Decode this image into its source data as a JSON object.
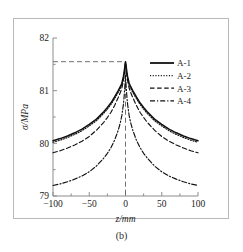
{
  "figure": {
    "caption": "(b)",
    "background_color": "#ffffff",
    "frame_color": "#b9b9b9",
    "axis_color": "#8c8c8c"
  },
  "chart_data": {
    "type": "line",
    "title": "",
    "xlabel": "z/mm",
    "ylabel": "σ/MPa",
    "xlim": [
      -100,
      100
    ],
    "ylim": [
      79,
      82
    ],
    "xticks": [
      -100,
      -50,
      0,
      50,
      100
    ],
    "xtick_labels": [
      "−100",
      "−50",
      "0",
      "50",
      "100"
    ],
    "yticks": [
      79,
      80,
      81,
      82
    ],
    "ytick_labels": [
      "79",
      "80",
      "81",
      "82"
    ],
    "grid": false,
    "legend_position": "upper right",
    "annotations": {
      "peak_guide_horizontal_value": 81.55,
      "peak_guide_vertical_value": 0
    },
    "series": [
      {
        "name": "A-1",
        "style": "solid",
        "color": "#111111",
        "x": [
          -100,
          -90,
          -80,
          -70,
          -60,
          -50,
          -40,
          -30,
          -25,
          -20,
          -15,
          -10,
          -7,
          -5,
          -3,
          -2,
          -1,
          0,
          1,
          2,
          3,
          5,
          7,
          10,
          15,
          20,
          25,
          30,
          40,
          50,
          60,
          70,
          80,
          90,
          100
        ],
        "y": [
          80.05,
          80.09,
          80.14,
          80.2,
          80.27,
          80.36,
          80.46,
          80.6,
          80.68,
          80.77,
          80.88,
          81.0,
          81.08,
          81.14,
          81.26,
          81.34,
          81.45,
          81.55,
          81.45,
          81.34,
          81.26,
          81.14,
          81.08,
          81.0,
          80.88,
          80.77,
          80.68,
          80.6,
          80.46,
          80.36,
          80.27,
          80.2,
          80.14,
          80.09,
          80.05
        ]
      },
      {
        "name": "A-2",
        "style": "dotted",
        "color": "#111111",
        "x": [
          -100,
          -90,
          -80,
          -70,
          -60,
          -50,
          -40,
          -30,
          -25,
          -20,
          -15,
          -10,
          -7,
          -5,
          -3,
          -2,
          -1,
          0,
          1,
          2,
          3,
          5,
          7,
          10,
          15,
          20,
          25,
          30,
          40,
          50,
          60,
          70,
          80,
          90,
          100
        ],
        "y": [
          80.02,
          80.06,
          80.11,
          80.17,
          80.24,
          80.33,
          80.43,
          80.57,
          80.65,
          80.74,
          80.85,
          80.97,
          81.05,
          81.11,
          81.23,
          81.31,
          81.43,
          81.54,
          81.43,
          81.31,
          81.23,
          81.11,
          81.05,
          80.97,
          80.85,
          80.74,
          80.65,
          80.57,
          80.43,
          80.33,
          80.24,
          80.17,
          80.11,
          80.06,
          80.02
        ]
      },
      {
        "name": "A-3",
        "style": "dashed",
        "color": "#111111",
        "x": [
          -100,
          -90,
          -80,
          -70,
          -60,
          -50,
          -40,
          -30,
          -25,
          -20,
          -15,
          -10,
          -7,
          -5,
          -3,
          -2,
          -1,
          0,
          1,
          2,
          3,
          5,
          7,
          10,
          15,
          20,
          25,
          30,
          40,
          50,
          60,
          70,
          80,
          90,
          100
        ],
        "y": [
          79.82,
          79.86,
          79.91,
          79.97,
          80.04,
          80.13,
          80.25,
          80.4,
          80.49,
          80.59,
          80.72,
          80.87,
          80.97,
          81.05,
          81.18,
          81.28,
          81.41,
          81.54,
          81.41,
          81.28,
          81.18,
          81.05,
          80.97,
          80.87,
          80.72,
          80.59,
          80.49,
          80.4,
          80.25,
          80.13,
          80.04,
          79.97,
          79.91,
          79.86,
          79.82
        ]
      },
      {
        "name": "A-4",
        "style": "dashdot",
        "color": "#111111",
        "x": [
          -100,
          -90,
          -80,
          -70,
          -60,
          -50,
          -40,
          -30,
          -25,
          -20,
          -15,
          -10,
          -7,
          -5,
          -3,
          -2,
          -1,
          0,
          1,
          2,
          3,
          5,
          7,
          10,
          15,
          20,
          25,
          30,
          40,
          50,
          60,
          70,
          80,
          90,
          100
        ],
        "y": [
          79.2,
          79.23,
          79.27,
          79.32,
          79.38,
          79.46,
          79.57,
          79.72,
          79.81,
          79.92,
          80.06,
          80.25,
          80.4,
          80.53,
          80.73,
          80.87,
          81.06,
          81.29,
          81.06,
          80.87,
          80.73,
          80.53,
          80.4,
          80.25,
          80.06,
          79.92,
          79.81,
          79.72,
          79.57,
          79.46,
          79.38,
          79.32,
          79.27,
          79.23,
          79.2
        ]
      }
    ],
    "legend": [
      {
        "label": "A-1",
        "style": "solid"
      },
      {
        "label": "A-2",
        "style": "dotted"
      },
      {
        "label": "A-3",
        "style": "dashed"
      },
      {
        "label": "A-4",
        "style": "dashdot"
      }
    ]
  }
}
